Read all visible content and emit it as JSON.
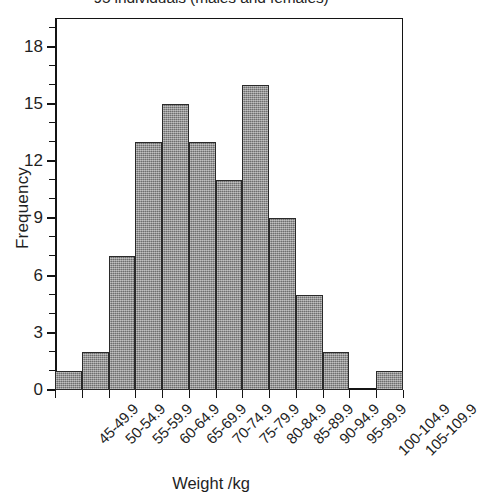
{
  "chart_data": {
    "type": "bar",
    "title": "95 individuals (males and females)",
    "xlabel": "Weight /kg",
    "ylabel": "Frequency",
    "categories": [
      "45-49.9",
      "50-54.9",
      "55-59.9",
      "60-64.9",
      "65-69.9",
      "70-74.9",
      "75-79.9",
      "80-84.9",
      "85-89.9",
      "90-94.9",
      "95-99.9",
      "100-104.9",
      "105-109.9"
    ],
    "values": [
      1,
      2,
      7,
      13,
      15,
      13,
      11,
      16,
      9,
      5,
      2,
      0,
      1
    ],
    "ylim": [
      0,
      19.5
    ],
    "y_major_ticks": [
      0,
      3,
      6,
      9,
      12,
      15,
      18
    ],
    "y_minor_ticks": [
      1,
      2,
      4,
      5,
      7,
      8,
      10,
      11,
      13,
      14,
      16,
      17,
      19
    ],
    "y_tick_labels": [
      "0",
      "3",
      "6",
      "9",
      "12",
      "15",
      "18"
    ],
    "grid": false,
    "legend": null,
    "bar_fill_color": "#8c8c8c",
    "bar_edge_color": "#2a2a2a",
    "axis_color": "#141414",
    "background_color": "#ffffff"
  }
}
